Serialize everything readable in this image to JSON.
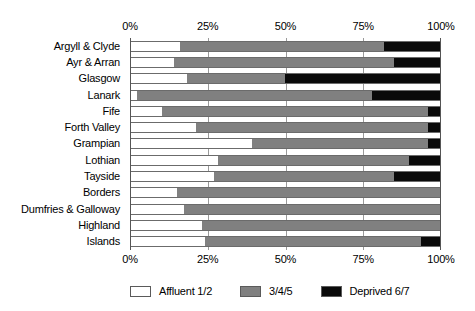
{
  "chart_data": {
    "type": "bar",
    "orientation": "horizontal",
    "stacked": true,
    "normalized": true,
    "title": "",
    "subtitle": "",
    "xlabel": "",
    "ylabel": "",
    "xlim": [
      0,
      100
    ],
    "grid": true,
    "grid_axis": "x",
    "legend_position": "bottom",
    "xticks": [
      0,
      25,
      50,
      75,
      100
    ],
    "xtick_labels": [
      "0%",
      "25%",
      "50%",
      "75%",
      "100%"
    ],
    "axis_top": true,
    "axis_bottom": true,
    "categories": [
      "Argyll & Clyde",
      "Ayr & Arran",
      "Glasgow",
      "Lanark",
      "Fife",
      "Forth Valley",
      "Grampian",
      "Lothian",
      "Tayside",
      "Borders",
      "Dumfries & Galloway",
      "Highland",
      "Islands"
    ],
    "series": [
      {
        "name": "Affluent 1/2",
        "color": "#ffffff",
        "values": [
          16,
          14,
          18,
          2,
          10,
          21,
          39,
          28,
          27,
          15,
          17,
          23,
          24
        ]
      },
      {
        "name": "3/4/5",
        "color": "#808080",
        "values": [
          66,
          71,
          32,
          76,
          86,
          75,
          57,
          62,
          58,
          85,
          83,
          77,
          70
        ]
      },
      {
        "name": "Deprived 6/7",
        "color": "#0a0a0a",
        "values": [
          18,
          15,
          50,
          22,
          4,
          4,
          4,
          10,
          15,
          0,
          0,
          0,
          6
        ]
      }
    ]
  },
  "legend": {
    "items": [
      {
        "label": "Affluent 1/2",
        "color": "#ffffff"
      },
      {
        "label": "3/4/5",
        "color": "#808080"
      },
      {
        "label": "Deprived 6/7",
        "color": "#0a0a0a"
      }
    ]
  }
}
